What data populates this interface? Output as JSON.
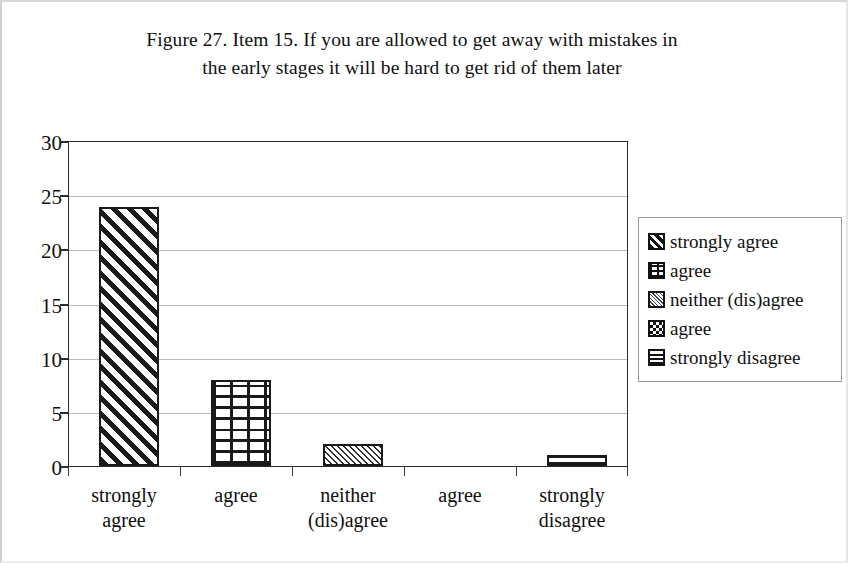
{
  "figure": {
    "title_line1": "Figure 27. Item 15. If you are allowed to get away with mistakes in",
    "title_line2": "the early stages it will be hard to get rid of them later"
  },
  "chart_data": {
    "type": "bar",
    "title": "Figure 27. Item 15. If you are allowed to get away with mistakes in the early stages it will be hard to get rid of them later",
    "xlabel": "",
    "ylabel": "",
    "categories": [
      "strongly agree",
      "agree",
      "neither (dis)agree",
      "agree",
      "strongly disagree"
    ],
    "values": [
      24,
      8,
      2,
      0,
      1
    ],
    "ylim": [
      0,
      30
    ],
    "yticks": [
      0,
      5,
      10,
      15,
      20,
      25,
      30
    ],
    "ytick_labels": [
      "0",
      "5",
      "10",
      "15",
      "20",
      "25",
      "30"
    ],
    "grid": true,
    "legend_position": "right",
    "series": [
      {
        "name": "strongly agree",
        "values": [
          24,
          0,
          0,
          0,
          0
        ],
        "pattern": "diagonal-stripes"
      },
      {
        "name": "agree",
        "values": [
          0,
          8,
          0,
          0,
          0
        ],
        "pattern": "brick"
      },
      {
        "name": "neither (dis)agree",
        "values": [
          0,
          0,
          2,
          0,
          0
        ],
        "pattern": "fine-diagonal-hatch"
      },
      {
        "name": "agree",
        "values": [
          0,
          0,
          0,
          0,
          0
        ],
        "pattern": "checkerboard"
      },
      {
        "name": "strongly disagree",
        "values": [
          0,
          0,
          0,
          0,
          1
        ],
        "pattern": "horizontal-lines"
      }
    ]
  },
  "xaxis": {
    "categories": [
      {
        "line1": "strongly",
        "line2": "agree"
      },
      {
        "line1": "agree",
        "line2": ""
      },
      {
        "line1": "neither",
        "line2": "(dis)agree"
      },
      {
        "line1": "agree",
        "line2": ""
      },
      {
        "line1": "strongly",
        "line2": "disagree"
      }
    ]
  },
  "yaxis": {
    "ticks": [
      "30",
      "25",
      "20",
      "15",
      "10",
      "5",
      "0"
    ]
  },
  "legend": {
    "items": [
      {
        "label": "strongly agree",
        "swatch": "diagonal-stripes-swatch"
      },
      {
        "label": "agree",
        "swatch": "brick-swatch"
      },
      {
        "label": "neither (dis)agree",
        "swatch": "fine-hatch-swatch"
      },
      {
        "label": "agree",
        "swatch": "checkerboard-swatch"
      },
      {
        "label": "strongly disagree",
        "swatch": "horizontal-lines-swatch"
      }
    ]
  },
  "colors": {
    "ink": "#1a1a1a",
    "grid": "#b9b9b9",
    "axis": "#2b2b2b",
    "background": "#ffffff",
    "legend_border": "#9a9a9a"
  }
}
